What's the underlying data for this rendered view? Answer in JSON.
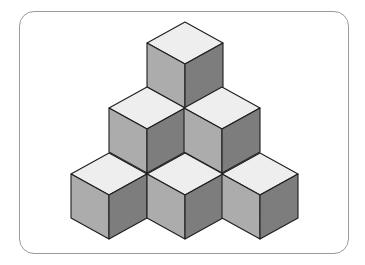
{
  "diagram": {
    "title": "",
    "colors": {
      "top_face": "#eeeeee",
      "left_face": "#acacac",
      "right_face": "#7d7d7d",
      "edge": "#1e1e1e",
      "frame_border": "#9a9a9a"
    },
    "cube_geometry": {
      "half_width": 38,
      "top_half_height": 21,
      "vertical_edge": 44
    },
    "cubes": [
      {
        "id": "cube-top",
        "row": 0,
        "x": 185,
        "y": 22
      },
      {
        "id": "cube-middle-left",
        "row": 1,
        "x": 147,
        "y": 87
      },
      {
        "id": "cube-middle-right",
        "row": 1,
        "x": 222,
        "y": 87
      },
      {
        "id": "cube-bottom-left",
        "row": 2,
        "x": 109,
        "y": 153
      },
      {
        "id": "cube-bottom-center",
        "row": 2,
        "x": 185,
        "y": 153
      },
      {
        "id": "cube-bottom-right",
        "row": 2,
        "x": 260,
        "y": 153
      }
    ]
  }
}
